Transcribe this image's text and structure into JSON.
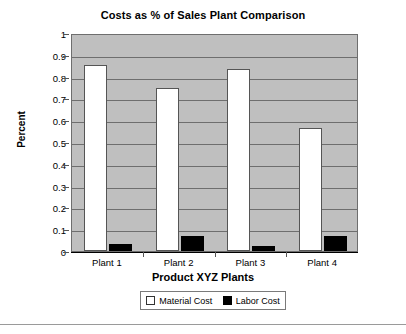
{
  "chart_data": {
    "type": "bar",
    "title": "Costs as % of Sales Plant Comparison",
    "xlabel": "Product XYZ Plants",
    "ylabel": "Percent",
    "categories": [
      "Plant 1",
      "Plant 2",
      "Plant 3",
      "Plant 4"
    ],
    "series": [
      {
        "name": "Material Cost",
        "values": [
          0.855,
          0.75,
          0.835,
          0.565
        ],
        "color": "#ffffff"
      },
      {
        "name": "Labor Cost",
        "values": [
          0.03,
          0.07,
          0.025,
          0.07
        ],
        "color": "#000000"
      }
    ],
    "ylim": [
      0,
      1
    ],
    "yticks": [
      0,
      0.1,
      0.2,
      0.3,
      0.4,
      0.5,
      0.6,
      0.7,
      0.8,
      0.9,
      1
    ],
    "ytick_labels": [
      "0",
      "0.1",
      "0.2",
      "0.3",
      "0.4",
      "0.5",
      "0.6",
      "0.7",
      "0.8",
      "0.9",
      "1"
    ],
    "grid": true,
    "grid_axis": "y",
    "legend_position": "bottom",
    "plot_background": "#bfbfbf",
    "gridline_color": "#6e6e6e",
    "axis_color": "#000000"
  }
}
